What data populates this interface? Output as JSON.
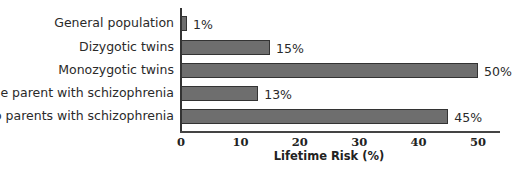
{
  "chart_data": {
    "type": "bar",
    "orientation": "horizontal",
    "title": "",
    "categories": [
      "General population",
      "Dizygotic twins",
      "Monozygotic twins",
      "One parent with schizophrenia",
      "Two parents with schizophrenia"
    ],
    "values": [
      1,
      15,
      50,
      13,
      45
    ],
    "value_labels": [
      "1%",
      "15%",
      "50%",
      "13%",
      "45%"
    ],
    "xlabel": "Lifetime Risk (%)",
    "ylabel": "",
    "xlim": [
      0,
      50
    ],
    "xticks": [
      "0",
      "10",
      "20",
      "30",
      "40",
      "50"
    ],
    "grid": false,
    "legend": null,
    "bar_color": "#6e6e6e"
  }
}
